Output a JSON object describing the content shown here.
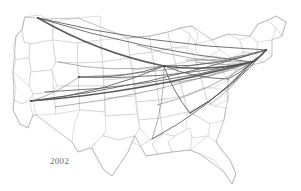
{
  "figure": {
    "year_label": "2002",
    "background_color": "#ffffff",
    "state_border_color": "#c2c2c2",
    "nation_border_color": "#a8a8a8",
    "route_color": "#5a5a5a",
    "route_color_heavy": "#4a4a4a",
    "label_color": "#6b6b6b"
  },
  "chart_data": {
    "type": "map",
    "title": "",
    "subtitle": "",
    "annotations": [
      "2002"
    ],
    "projection": "usa-albers",
    "xlabel": "",
    "ylabel": "",
    "grid": false,
    "legend": null,
    "basemap": {
      "region": "contiguous-united-states",
      "layers": [
        "state-boundaries",
        "national-outline"
      ]
    },
    "nodes": [
      {
        "id": "SEA",
        "name": "Seattle",
        "x": 38,
        "y": 18,
        "hub": true
      },
      {
        "id": "PDX",
        "name": "Portland",
        "x": 28,
        "y": 28,
        "hub": false
      },
      {
        "id": "SFO",
        "name": "San Francisco",
        "x": 16,
        "y": 78,
        "hub": false
      },
      {
        "id": "LAX",
        "name": "Los Angeles",
        "x": 31,
        "y": 101,
        "hub": true
      },
      {
        "id": "LAS",
        "name": "Las Vegas",
        "x": 45,
        "y": 92,
        "hub": false
      },
      {
        "id": "PHX",
        "name": "Phoenix",
        "x": 55,
        "y": 107,
        "hub": false
      },
      {
        "id": "SLC",
        "name": "Salt Lake City",
        "x": 58,
        "y": 62,
        "hub": false
      },
      {
        "id": "DEN",
        "name": "Denver",
        "x": 79,
        "y": 77,
        "hub": true
      },
      {
        "id": "MSP",
        "name": "Minneapolis",
        "x": 137,
        "y": 45,
        "hub": false
      },
      {
        "id": "ORD",
        "name": "Chicago",
        "x": 164,
        "y": 66,
        "hub": true
      },
      {
        "id": "DTW",
        "name": "Detroit",
        "x": 186,
        "y": 60,
        "hub": false
      },
      {
        "id": "CLE",
        "name": "Cleveland",
        "x": 196,
        "y": 62,
        "hub": false
      },
      {
        "id": "PIT",
        "name": "Pittsburgh",
        "x": 207,
        "y": 68,
        "hub": false
      },
      {
        "id": "STL",
        "name": "St. Louis",
        "x": 155,
        "y": 84,
        "hub": false
      },
      {
        "id": "MEM",
        "name": "Memphis",
        "x": 157,
        "y": 105,
        "hub": false
      },
      {
        "id": "ATL",
        "name": "Atlanta",
        "x": 190,
        "y": 113,
        "hub": false
      },
      {
        "id": "MSY",
        "name": "New Orleans",
        "x": 152,
        "y": 139,
        "hub": false
      },
      {
        "id": "CLT",
        "name": "Charlotte",
        "x": 209,
        "y": 105,
        "hub": false
      },
      {
        "id": "IAD",
        "name": "Washington DC",
        "x": 228,
        "y": 79,
        "hub": false
      },
      {
        "id": "PHL",
        "name": "Philadelphia",
        "x": 243,
        "y": 68,
        "hub": false
      },
      {
        "id": "JFK",
        "name": "New York",
        "x": 252,
        "y": 62,
        "hub": true
      },
      {
        "id": "BOS",
        "name": "Boston",
        "x": 266,
        "y": 50,
        "hub": true
      },
      {
        "id": "BDL",
        "name": "Hartford",
        "x": 258,
        "y": 55,
        "hub": false
      }
    ],
    "routes": [
      {
        "from": "SEA",
        "to": "ORD",
        "weight": 1.4
      },
      {
        "from": "SEA",
        "to": "JFK",
        "weight": 1.1
      },
      {
        "from": "SEA",
        "to": "BOS",
        "weight": 0.9
      },
      {
        "from": "LAX",
        "to": "JFK",
        "weight": 1.6
      },
      {
        "from": "LAX",
        "to": "BOS",
        "weight": 1.2
      },
      {
        "from": "LAX",
        "to": "ORD",
        "weight": 1.0
      },
      {
        "from": "LAX",
        "to": "DEN",
        "weight": 0.8
      },
      {
        "from": "LAS",
        "to": "JFK",
        "weight": 1.0
      },
      {
        "from": "PHX",
        "to": "JFK",
        "weight": 0.8
      },
      {
        "from": "DEN",
        "to": "ORD",
        "weight": 1.1
      },
      {
        "from": "DEN",
        "to": "JFK",
        "weight": 1.2
      },
      {
        "from": "DEN",
        "to": "BOS",
        "weight": 0.8
      },
      {
        "from": "SLC",
        "to": "ORD",
        "weight": 0.7
      },
      {
        "from": "ORD",
        "to": "JFK",
        "weight": 1.6
      },
      {
        "from": "ORD",
        "to": "BOS",
        "weight": 1.3
      },
      {
        "from": "ORD",
        "to": "IAD",
        "weight": 0.9
      },
      {
        "from": "ORD",
        "to": "ATL",
        "weight": 0.9
      },
      {
        "from": "ORD",
        "to": "MSY",
        "weight": 0.8
      },
      {
        "from": "MSP",
        "to": "JFK",
        "weight": 0.8
      },
      {
        "from": "DTW",
        "to": "BOS",
        "weight": 0.8
      },
      {
        "from": "CLE",
        "to": "JFK",
        "weight": 0.7
      },
      {
        "from": "STL",
        "to": "JFK",
        "weight": 0.7
      },
      {
        "from": "MEM",
        "to": "JFK",
        "weight": 0.7
      },
      {
        "from": "ATL",
        "to": "JFK",
        "weight": 1.2
      },
      {
        "from": "ATL",
        "to": "BOS",
        "weight": 0.9
      },
      {
        "from": "MSY",
        "to": "JFK",
        "weight": 0.9
      },
      {
        "from": "CLT",
        "to": "JFK",
        "weight": 0.8
      },
      {
        "from": "IAD",
        "to": "BOS",
        "weight": 1.0
      },
      {
        "from": "PHL",
        "to": "BOS",
        "weight": 0.8
      },
      {
        "from": "JFK",
        "to": "BOS",
        "weight": 1.5
      }
    ]
  }
}
